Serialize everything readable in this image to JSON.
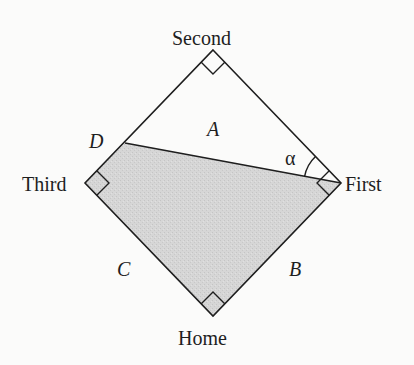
{
  "diagram": {
    "type": "geometry",
    "colors": {
      "background": "#fbfbfa",
      "stroke": "#1e1e1e",
      "shade_fill": "#d3d3d3"
    },
    "vertices": {
      "second": {
        "label": "Second",
        "x": 213,
        "y": 50
      },
      "first": {
        "label": "First",
        "x": 341,
        "y": 183
      },
      "home": {
        "label": "Home",
        "x": 213,
        "y": 316
      },
      "third": {
        "label": "Third",
        "x": 85,
        "y": 183
      },
      "d": {
        "label": "D",
        "x": 125,
        "y": 143
      }
    },
    "region_labels": {
      "a": "A",
      "b": "B",
      "c": "C"
    },
    "angle_label": "α",
    "right_angles_at": [
      "Second",
      "First",
      "Third",
      "Home"
    ]
  }
}
